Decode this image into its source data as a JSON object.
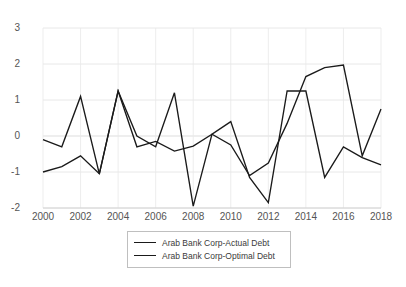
{
  "chart_data": {
    "type": "line",
    "title": "",
    "subtitle": "",
    "xlabel": "",
    "ylabel": "",
    "x": [
      2000,
      2001,
      2002,
      2003,
      2004,
      2005,
      2006,
      2007,
      2008,
      2009,
      2010,
      2011,
      2012,
      2013,
      2014,
      2015,
      2016,
      2017,
      2018
    ],
    "xlim": [
      2000,
      2018
    ],
    "ylim": [
      -2,
      3
    ],
    "yticks": [
      3,
      2,
      1,
      0,
      -1,
      -2
    ],
    "xticks": [
      2000,
      2002,
      2004,
      2006,
      2008,
      2010,
      2012,
      2014,
      2016,
      2018
    ],
    "grid": true,
    "legend_position": "bottom-center",
    "series": [
      {
        "name": "Arab Bank Corp-Actual Debt",
        "color": "#1a1a1a",
        "values": [
          -0.1,
          -0.3,
          1.1,
          -1.05,
          1.25,
          0.0,
          -0.3,
          1.2,
          -1.95,
          0.05,
          0.4,
          -1.15,
          -1.85,
          1.25,
          1.25,
          -1.15,
          -0.3,
          -0.6,
          -0.8
        ]
      },
      {
        "name": "Arab Bank Corp-Optimal Debt",
        "color": "#1a1a1a",
        "values": [
          -1.0,
          -0.85,
          -0.55,
          -1.05,
          1.25,
          -0.3,
          -0.15,
          -0.42,
          -0.28,
          0.05,
          -0.25,
          -1.1,
          -0.75,
          0.35,
          1.65,
          1.9,
          1.97,
          -0.55,
          0.75
        ]
      }
    ]
  },
  "axes": {
    "ytick_labels": [
      "3",
      "2",
      "1",
      "0",
      "-1",
      "-2"
    ],
    "xtick_labels": [
      "2000",
      "2002",
      "2004",
      "2006",
      "2008",
      "2010",
      "2012",
      "2014",
      "2016",
      "2018"
    ]
  },
  "legend": {
    "items": [
      {
        "label": "Arab Bank Corp-Actual Debt"
      },
      {
        "label": "Arab Bank Corp-Optimal Debt"
      }
    ]
  }
}
